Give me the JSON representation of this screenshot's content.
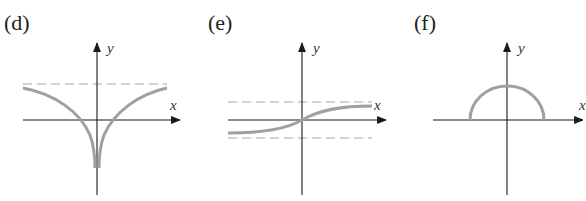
{
  "panels": [
    {
      "id": "d",
      "label": "(d)",
      "x_axis_label": "x",
      "y_axis_label": "y",
      "description": "Even function with vertical cusp going to negative infinity at x=0, approaching horizontal asymptote from below as |x| grows",
      "asymptotes": [
        "horizontal dashed line above x-axis"
      ]
    },
    {
      "id": "e",
      "label": "(e)",
      "x_axis_label": "x",
      "y_axis_label": "y",
      "description": "Increasing odd sigmoid-shaped function through origin, bounded between two horizontal dashed asymptotes",
      "asymptotes": [
        "horizontal dashed line above x-axis",
        "horizontal dashed line below x-axis"
      ]
    },
    {
      "id": "f",
      "label": "(f)",
      "x_axis_label": "x",
      "y_axis_label": "y",
      "description": "Upper semicircle centered at origin resting on x-axis",
      "asymptotes": []
    }
  ],
  "colors": {
    "axis": "#1a1a1a",
    "curve": "#a0a0a0",
    "dashed": "#a8a8a8",
    "text": "#222222"
  }
}
